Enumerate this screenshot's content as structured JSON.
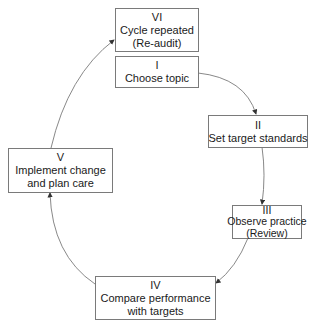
{
  "diagram": {
    "type": "cycle",
    "steps": [
      {
        "id": "I",
        "numeral": "I",
        "lines": [
          "Choose topic"
        ]
      },
      {
        "id": "II",
        "numeral": "II",
        "lines": [
          "Set target standards"
        ]
      },
      {
        "id": "III",
        "numeral": "III",
        "lines": [
          "Observe practice",
          "(Review)"
        ]
      },
      {
        "id": "IV",
        "numeral": "IV",
        "lines": [
          "Compare performance",
          "with targets"
        ]
      },
      {
        "id": "V",
        "numeral": "V",
        "lines": [
          "Implement change",
          "and plan care"
        ]
      },
      {
        "id": "VI",
        "numeral": "VI",
        "lines": [
          "Cycle repeated",
          "(Re-audit)"
        ]
      }
    ],
    "edges": [
      [
        "I",
        "II"
      ],
      [
        "II",
        "III"
      ],
      [
        "III",
        "IV"
      ],
      [
        "IV",
        "V"
      ],
      [
        "V",
        "VI"
      ]
    ],
    "colors": {
      "stroke": "#7a7a7a",
      "text": "#1a1a1a",
      "background": "#ffffff"
    }
  }
}
